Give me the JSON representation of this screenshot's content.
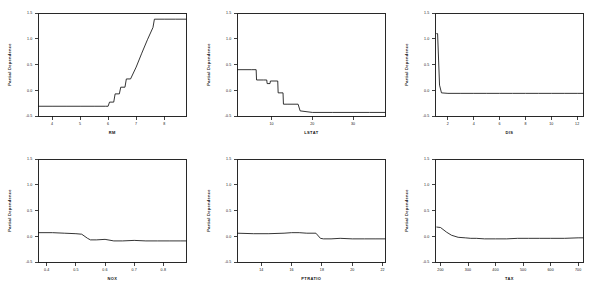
{
  "figure": {
    "background": "#ffffff",
    "line_color": "#111111",
    "axis_color": "#111111",
    "rows": 2,
    "cols": 3
  },
  "chart_data": [
    {
      "type": "line",
      "title": "",
      "xlabel": "RM",
      "ylabel": "Partial Dependence",
      "xlim": [
        3.5,
        8.8
      ],
      "ylim": [
        -0.5,
        1.5
      ],
      "xticks": [
        4,
        5,
        6,
        7,
        8
      ],
      "xticklabels": [
        "4",
        "5",
        "6",
        "7",
        "8"
      ],
      "yticks": [
        -0.5,
        0.0,
        0.5,
        1.0,
        1.5
      ],
      "yticklabels": [
        "-0.5",
        "0.0",
        "0.5",
        "1.0",
        "1.5"
      ],
      "grid": false,
      "legend": "none",
      "x": [
        3.5,
        4.0,
        4.5,
        5.0,
        5.5,
        5.9,
        6.0,
        6.05,
        6.2,
        6.25,
        6.4,
        6.45,
        6.6,
        6.65,
        6.8,
        7.0,
        7.2,
        7.4,
        7.6,
        7.65,
        8.0,
        8.4,
        8.8
      ],
      "y": [
        -0.31,
        -0.31,
        -0.31,
        -0.31,
        -0.31,
        -0.31,
        -0.31,
        -0.23,
        -0.23,
        -0.07,
        -0.07,
        0.06,
        0.06,
        0.22,
        0.22,
        0.45,
        0.72,
        0.98,
        1.22,
        1.38,
        1.38,
        1.38,
        1.38
      ]
    },
    {
      "type": "line",
      "title": "",
      "xlabel": "LSTAT",
      "ylabel": "Partial Dependence",
      "xlim": [
        1.5,
        38
      ],
      "ylim": [
        -0.5,
        1.5
      ],
      "xticks": [
        10,
        20,
        30
      ],
      "xticklabels": [
        "10",
        "20",
        "30"
      ],
      "yticks": [
        -0.5,
        0.0,
        0.5,
        1.0,
        1.5
      ],
      "yticklabels": [
        "-0.5",
        "0.0",
        "0.5",
        "1.0",
        "1.5"
      ],
      "grid": false,
      "legend": "none",
      "x": [
        1.5,
        5.0,
        6.2,
        6.3,
        8.0,
        8.8,
        8.9,
        9.6,
        9.7,
        11.5,
        11.6,
        12.8,
        12.9,
        14.0,
        16.5,
        17.0,
        20.0,
        25.0,
        30.0,
        34.0,
        38.0
      ],
      "y": [
        0.4,
        0.4,
        0.4,
        0.2,
        0.2,
        0.2,
        0.13,
        0.13,
        0.18,
        0.18,
        -0.05,
        -0.05,
        -0.27,
        -0.27,
        -0.27,
        -0.4,
        -0.43,
        -0.43,
        -0.43,
        -0.43,
        -0.43
      ]
    },
    {
      "type": "line",
      "title": "",
      "xlabel": "DIS",
      "ylabel": "Partial Dependence",
      "xlim": [
        1.0,
        12.5
      ],
      "ylim": [
        -0.5,
        1.5
      ],
      "xticks": [
        2,
        4,
        6,
        8,
        10,
        12
      ],
      "xticklabels": [
        "2",
        "4",
        "6",
        "8",
        "10",
        "12"
      ],
      "yticks": [
        -0.5,
        0.0,
        0.5,
        1.0,
        1.5
      ],
      "yticklabels": [
        "-0.5",
        "0.0",
        "0.5",
        "1.0",
        "1.5"
      ],
      "grid": false,
      "legend": "none",
      "x": [
        1.1,
        1.2,
        1.35,
        1.5,
        2.0,
        3.0,
        4.0,
        5.0,
        6.0,
        7.0,
        8.0,
        9.0,
        10.0,
        11.0,
        12.0,
        12.5
      ],
      "y": [
        1.1,
        1.1,
        0.1,
        -0.05,
        -0.06,
        -0.06,
        -0.06,
        -0.06,
        -0.06,
        -0.06,
        -0.06,
        -0.06,
        -0.06,
        -0.06,
        -0.06,
        -0.06
      ]
    },
    {
      "type": "line",
      "title": "",
      "xlabel": "NOX",
      "ylabel": "Partial Dependence",
      "xlim": [
        0.37,
        0.88
      ],
      "ylim": [
        -0.5,
        1.5
      ],
      "xticks": [
        0.4,
        0.5,
        0.6,
        0.7,
        0.8
      ],
      "xticklabels": [
        "0.4",
        "0.5",
        "0.6",
        "0.7",
        "0.8"
      ],
      "yticks": [
        -0.5,
        0.0,
        0.5,
        1.0,
        1.5
      ],
      "yticklabels": [
        "-0.5",
        "0.0",
        "0.5",
        "1.0",
        "1.5"
      ],
      "grid": false,
      "legend": "none",
      "x": [
        0.37,
        0.42,
        0.46,
        0.5,
        0.52,
        0.54,
        0.55,
        0.57,
        0.6,
        0.63,
        0.66,
        0.7,
        0.74,
        0.78,
        0.82,
        0.86,
        0.88
      ],
      "y": [
        0.07,
        0.07,
        0.06,
        0.05,
        0.04,
        -0.04,
        -0.07,
        -0.07,
        -0.06,
        -0.09,
        -0.09,
        -0.08,
        -0.09,
        -0.09,
        -0.09,
        -0.09,
        -0.09
      ]
    },
    {
      "type": "line",
      "title": "",
      "xlabel": "PTRATIO",
      "ylabel": "Partial Dependence",
      "xlim": [
        12.4,
        22.2
      ],
      "ylim": [
        -0.5,
        1.5
      ],
      "xticks": [
        14,
        16,
        18,
        20,
        22
      ],
      "xticklabels": [
        "14",
        "16",
        "18",
        "20",
        "22"
      ],
      "yticks": [
        -0.5,
        0.0,
        0.5,
        1.0,
        1.5
      ],
      "yticklabels": [
        "-0.5",
        "0.0",
        "0.5",
        "1.0",
        "1.5"
      ],
      "grid": false,
      "legend": "none",
      "x": [
        12.4,
        13.5,
        14.5,
        15.5,
        16.0,
        16.5,
        17.0,
        17.6,
        17.9,
        18.1,
        18.6,
        19.2,
        20.0,
        20.8,
        21.5,
        22.2
      ],
      "y": [
        0.06,
        0.05,
        0.05,
        0.06,
        0.07,
        0.07,
        0.06,
        0.06,
        -0.04,
        -0.05,
        -0.05,
        -0.04,
        -0.05,
        -0.05,
        -0.05,
        -0.05
      ]
    },
    {
      "type": "line",
      "title": "",
      "xlabel": "TAX",
      "ylabel": "Partial Dependence",
      "xlim": [
        180,
        720
      ],
      "ylim": [
        -0.5,
        1.5
      ],
      "xticks": [
        200,
        300,
        400,
        500,
        600,
        700
      ],
      "xticklabels": [
        "200",
        "300",
        "400",
        "500",
        "600",
        "700"
      ],
      "yticks": [
        -0.5,
        0.0,
        0.5,
        1.0,
        1.5
      ],
      "yticklabels": [
        "-0.5",
        "0.0",
        "0.5",
        "1.0",
        "1.5"
      ],
      "grid": false,
      "legend": "none",
      "x": [
        185,
        200,
        222,
        240,
        264,
        290,
        310,
        330,
        360,
        400,
        440,
        480,
        520,
        560,
        600,
        650,
        700,
        720
      ],
      "y": [
        0.18,
        0.17,
        0.08,
        0.02,
        -0.02,
        -0.03,
        -0.04,
        -0.04,
        -0.05,
        -0.05,
        -0.05,
        -0.04,
        -0.04,
        -0.04,
        -0.04,
        -0.04,
        -0.03,
        -0.03
      ]
    }
  ]
}
